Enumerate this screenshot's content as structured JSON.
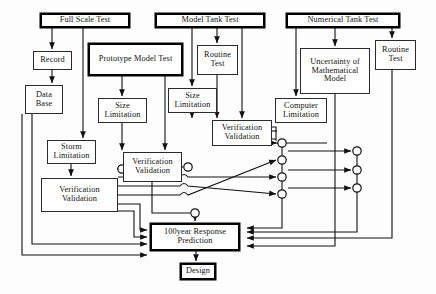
{
  "diagram": {
    "type": "flowchart",
    "colors": {
      "background": "#fdfdfd",
      "stroke": "#111111",
      "node_fill": "#ffffff",
      "emphasis_border": "#000000"
    },
    "nodes": [
      {
        "id": "full-scale-test",
        "label": "Full Scale Test",
        "x": 40,
        "y": 13,
        "w": 90,
        "h": 15,
        "emphasis": "thick",
        "font": 8.3
      },
      {
        "id": "model-tank-test",
        "label": "Model Tank Test",
        "x": 155,
        "y": 13,
        "w": 110,
        "h": 15,
        "emphasis": "thick",
        "font": 8.3
      },
      {
        "id": "numerical-tank-test",
        "label": "Numerical Tank Test",
        "x": 286,
        "y": 13,
        "w": 114,
        "h": 15,
        "emphasis": "thick",
        "font": 8.3
      },
      {
        "id": "record",
        "label": "Record",
        "x": 33,
        "y": 51,
        "w": 39,
        "h": 19,
        "emphasis": "thin",
        "font": 8.3
      },
      {
        "id": "prototype-model-test",
        "label": "Prototype Model Test",
        "x": 88,
        "y": 43,
        "w": 95,
        "h": 33,
        "emphasis": "thick",
        "font": 8.3
      },
      {
        "id": "routine-test-middle",
        "label": "Routine Test",
        "x": 197,
        "y": 45,
        "w": 41,
        "h": 30,
        "emphasis": "thin",
        "font": 8.3
      },
      {
        "id": "uncertainty-math-model",
        "label": "Uncertainty of Mathematical Model",
        "x": 300,
        "y": 48,
        "w": 70,
        "h": 46,
        "emphasis": "thin",
        "font": 8.3
      },
      {
        "id": "routine-test-right",
        "label": "Routine Test",
        "x": 375,
        "y": 40,
        "w": 41,
        "h": 30,
        "emphasis": "thin",
        "font": 8.3
      },
      {
        "id": "data-base",
        "label": "Data Base",
        "x": 25,
        "y": 85,
        "w": 38,
        "h": 29,
        "emphasis": "thin",
        "font": 8.3
      },
      {
        "id": "size-limitation-left",
        "label": "Size Limitation",
        "x": 98,
        "y": 98,
        "w": 49,
        "h": 25,
        "emphasis": "thin",
        "font": 8.3
      },
      {
        "id": "size-limitation-right",
        "label": "Size Limitation",
        "x": 168,
        "y": 88,
        "w": 49,
        "h": 25,
        "emphasis": "thin",
        "font": 8.3
      },
      {
        "id": "computer-limitation",
        "label": "Computer Limitation",
        "x": 275,
        "y": 98,
        "w": 52,
        "h": 25,
        "emphasis": "thin",
        "font": 8.3
      },
      {
        "id": "verification-validation-right",
        "label": "Verification Validation",
        "x": 212,
        "y": 120,
        "w": 60,
        "h": 26,
        "emphasis": "thin",
        "font": 8.3
      },
      {
        "id": "storm-limitation",
        "label": "Storm Limitation",
        "x": 47,
        "y": 140,
        "w": 49,
        "h": 24,
        "emphasis": "thin",
        "font": 8.3
      },
      {
        "id": "verification-validation-middle",
        "label": "Verification Validation",
        "x": 123,
        "y": 152,
        "w": 59,
        "h": 30,
        "emphasis": "thin",
        "font": 8.3
      },
      {
        "id": "verification-validation-left",
        "label": "Verification Validation",
        "x": 41,
        "y": 178,
        "w": 77,
        "h": 34,
        "emphasis": "thin",
        "font": 8.3
      },
      {
        "id": "response-prediction",
        "label": "100year Response Prediction",
        "x": 150,
        "y": 223,
        "w": 90,
        "h": 28,
        "emphasis": "thick",
        "font": 8.3
      },
      {
        "id": "design",
        "label": "Design",
        "x": 180,
        "y": 263,
        "w": 36,
        "h": 17,
        "emphasis": "thick",
        "font": 8.3
      }
    ],
    "junctions": [
      {
        "id": "junction-a",
        "x": 122,
        "y": 169
      },
      {
        "id": "junction-b",
        "x": 282,
        "y": 143
      },
      {
        "id": "junction-c",
        "x": 188,
        "y": 167
      },
      {
        "id": "junction-d",
        "x": 282,
        "y": 160
      },
      {
        "id": "junction-e",
        "x": 282,
        "y": 177
      },
      {
        "id": "junction-f",
        "x": 282,
        "y": 194
      },
      {
        "id": "junction-g",
        "x": 357,
        "y": 151
      },
      {
        "id": "junction-h",
        "x": 357,
        "y": 170
      },
      {
        "id": "junction-i",
        "x": 357,
        "y": 188
      },
      {
        "id": "junction-j",
        "x": 195,
        "y": 213
      }
    ]
  }
}
